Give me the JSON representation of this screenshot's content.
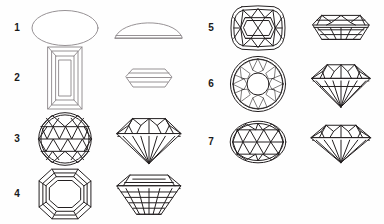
{
  "figure": {
    "background_color": "#ffffff",
    "line_color": "#231f20",
    "columns": 2,
    "views_per_item": [
      "face-up view",
      "profile view"
    ],
    "items": [
      {
        "number": "1",
        "cut_name": "Cabochon",
        "face_shape": "oval outline, unfaceted",
        "profile_shape": "domed half-ellipse with flat base",
        "column": "left",
        "row": 1
      },
      {
        "number": "2",
        "cut_name": "Baguette step cut",
        "face_shape": "elongated rectangle with nested rectangular step facets",
        "profile_shape": "flat hexagonal outline with horizontal step lines",
        "column": "left",
        "row": 2
      },
      {
        "number": "3",
        "cut_name": "Round brilliant (star faceted crown)",
        "face_shape": "circle with triangular star and bezel facet network",
        "profile_shape": "brilliant profile, shallow crown and deep pointed pavilion",
        "column": "left",
        "row": 3
      },
      {
        "number": "4",
        "cut_name": "Emerald cut (octagon step cut)",
        "face_shape": "octagon with nested octagonal step facets and corner facets",
        "profile_shape": "trapezoidal step cut with horizontal banded pavilion",
        "column": "left",
        "row": 4
      },
      {
        "number": "5",
        "cut_name": "Cushion / rectangular cushion brilliant",
        "face_shape": "rounded rectangle with crossed kite and star facets",
        "profile_shape": "shallow elongated hexagonal profile with horizontal facet lines",
        "column": "right",
        "row": 1
      },
      {
        "number": "6",
        "cut_name": "Round brilliant (circular table)",
        "face_shape": "circle with circular table and ring of kite and star facets",
        "profile_shape": "classic brilliant profile with pointed culet",
        "column": "right",
        "row": 2
      },
      {
        "number": "7",
        "cut_name": "Oval brilliant",
        "face_shape": "oval with crossed facet network",
        "profile_shape": "wide brilliant profile with pointed culet",
        "column": "right",
        "row": 3
      }
    ]
  }
}
